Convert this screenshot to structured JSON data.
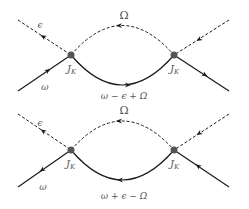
{
  "diagrams": [
    {
      "id": "top",
      "labels": {
        "boson": "Ω",
        "outgoing": "ϵ",
        "incoming": "ω",
        "vertex_left": "J",
        "vertex_right": "J",
        "vertex_sub": "K",
        "internal": "ω − ϵ + Ω"
      }
    },
    {
      "id": "bottom",
      "labels": {
        "boson": "Ω",
        "outgoing": "ϵ",
        "incoming": "ω",
        "vertex_left": "J",
        "vertex_right": "J",
        "vertex_sub": "K",
        "internal": "ω + ϵ − Ω"
      }
    }
  ],
  "colors": {
    "line": "#1a1a1a",
    "vertex": "#555555",
    "label": "#555555"
  }
}
